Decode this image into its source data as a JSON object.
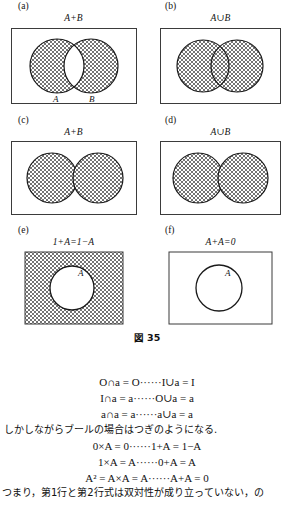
{
  "figure": {
    "caption": "図 35",
    "panels": [
      {
        "letter": "(a)",
        "title": "A+B",
        "kind": "two-circles-overlap",
        "fill": "symmetric-difference",
        "circle_labels_below": [
          "A",
          "B"
        ],
        "inner_label": ""
      },
      {
        "letter": "(b)",
        "title": "A∪B",
        "kind": "two-circles-overlap",
        "fill": "union",
        "circle_labels_below": [],
        "inner_label": ""
      },
      {
        "letter": "(c)",
        "title": "A+B",
        "kind": "two-circles-disjoint",
        "fill": "both",
        "circle_labels_below": [],
        "inner_label": ""
      },
      {
        "letter": "(d)",
        "title": "A∪B",
        "kind": "two-circles-disjoint",
        "fill": "both",
        "circle_labels_below": [],
        "inner_label": ""
      },
      {
        "letter": "(e)",
        "title": "1+A=1−A",
        "kind": "complement",
        "fill": "outside-only",
        "circle_labels_below": [],
        "inner_label": "A"
      },
      {
        "letter": "(f)",
        "title": "A+A=0",
        "kind": "empty",
        "fill": "none",
        "circle_labels_below": [],
        "inner_label": "A"
      }
    ]
  },
  "equations": {
    "set_laws": [
      "O∩a = O······I∪a = I",
      "I∩a = a······O∪a = a",
      "a∩a = a······a∪a = a"
    ],
    "transition_text": "しかしながらブールの場合はつぎのようになる.",
    "boole_laws": [
      "0×A = 0······1+A = 1−A",
      "1×A = A······0+A = A",
      "A² = A×A = A······A+A = 0"
    ],
    "trailing_text": "つまり，第1行と第2行式は双対性が成り立っていない，の"
  },
  "colors": {
    "ink": "#1a1a1a",
    "rule": "#444444",
    "hatch": "#555555",
    "paper": "#ffffff"
  }
}
